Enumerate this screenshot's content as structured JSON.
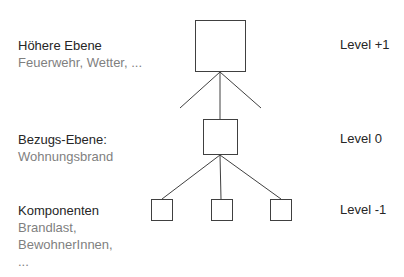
{
  "levels": [
    {
      "title": "Höhere Ebene",
      "description": [
        "Feuerwehr, Wetter, ..."
      ],
      "level_label": "Level +1"
    },
    {
      "title": "Bezugs-Ebene:",
      "description": [
        "Wohnungsbrand"
      ],
      "level_label": "Level 0"
    },
    {
      "title": "Komponenten",
      "description": [
        "Brandlast,",
        "BewohnerInnen,",
        "..."
      ],
      "level_label": "Level -1"
    }
  ],
  "colors": {
    "stroke": "#404040",
    "heading": "#262626",
    "muted": "#7f7f7f"
  }
}
